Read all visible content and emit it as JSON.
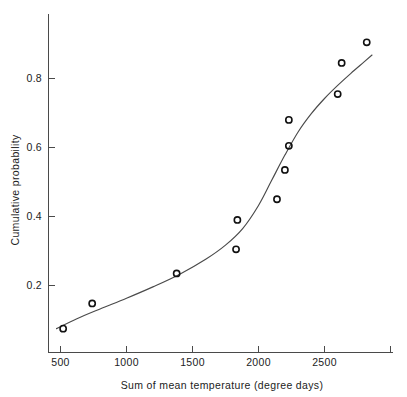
{
  "chart_data": {
    "type": "scatter",
    "title": "",
    "xlabel": "Sum of mean temperature (degree days)",
    "ylabel": "Cumulative probability",
    "xlim": [
      380,
      3010
    ],
    "ylim": [
      0.0,
      0.98
    ],
    "grid": false,
    "legend": null,
    "xticks": [
      500,
      1000,
      1500,
      2000,
      2500,
      3000
    ],
    "xticklabels": [
      "500",
      "1000",
      "1500",
      "2000",
      "2500",
      ""
    ],
    "yticks": [
      0.2,
      0.4,
      0.6,
      0.8
    ],
    "yticklabels": [
      "0.2",
      "0.4",
      "0.6",
      "0.8"
    ],
    "series": [
      {
        "name": "observed",
        "marker": "open-circle",
        "x": [
          520,
          740,
          1380,
          1830,
          1840,
          2140,
          2200,
          2230,
          2230,
          2600,
          2630,
          2820
        ],
        "y": [
          0.075,
          0.148,
          0.235,
          0.305,
          0.39,
          0.45,
          0.535,
          0.605,
          0.68,
          0.755,
          0.845,
          0.905
        ]
      },
      {
        "name": "fitted-curve",
        "marker": "none",
        "x": [
          470,
          620,
          800,
          1000,
          1200,
          1400,
          1600,
          1750,
          1880,
          2000,
          2100,
          2200,
          2300,
          2400,
          2500,
          2600,
          2700,
          2800,
          2860
        ],
        "y": [
          0.075,
          0.103,
          0.132,
          0.163,
          0.196,
          0.232,
          0.276,
          0.317,
          0.365,
          0.432,
          0.505,
          0.578,
          0.645,
          0.698,
          0.742,
          0.78,
          0.815,
          0.848,
          0.868
        ]
      }
    ]
  },
  "axis": {
    "x_tick_500": "500",
    "x_tick_1000": "1000",
    "x_tick_1500": "1500",
    "x_tick_2000": "2000",
    "x_tick_2500": "2500",
    "y_tick_02": "0.2",
    "y_tick_04": "0.4",
    "y_tick_06": "0.6",
    "y_tick_08": "0.8",
    "x_title": "Sum of mean temperature (degree days)",
    "y_title": "Cumulative  probability"
  },
  "colors": {
    "axis": "#4a4a4a",
    "curve": "#4a4a4a",
    "marker": "#111111",
    "text": "#1c1c1c",
    "background": "#ffffff"
  }
}
